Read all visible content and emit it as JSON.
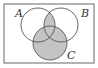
{
  "diagram": {
    "type": "venn",
    "sets": [
      {
        "label": "A",
        "cx": 38,
        "cy": 25,
        "r": 17
      },
      {
        "label": "B",
        "cx": 61,
        "cy": 25,
        "r": 17
      },
      {
        "label": "C",
        "cx": 50,
        "cy": 43,
        "r": 17
      }
    ],
    "shaded_region": "(A ∩ B) ∪ C",
    "colors": {
      "shade": "#c4c4c4",
      "stroke": "#555555",
      "border": "#666666",
      "background": "#ffffff"
    }
  },
  "labels": {
    "a": "A",
    "b": "B",
    "c": "C"
  }
}
